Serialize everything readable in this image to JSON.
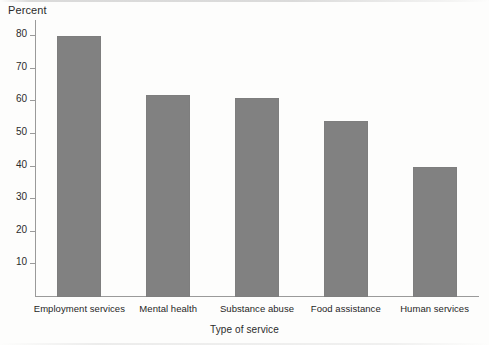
{
  "chart_data": {
    "type": "bar",
    "title": "",
    "subtitle": "",
    "categories": [
      "Employment services",
      "Mental health",
      "Substance abuse",
      "Food assistance",
      "Human services"
    ],
    "values": [
      80,
      62,
      61,
      54,
      40
    ],
    "series": [
      {
        "name": "Percent",
        "values": [
          80,
          62,
          61,
          54,
          40
        ]
      }
    ],
    "xlabel": "Type of service",
    "ylabel": "Percent",
    "ylim": [
      0,
      85
    ],
    "yticks": [
      10,
      20,
      30,
      40,
      50,
      60,
      70,
      80
    ],
    "ytick_labels": [
      "10",
      "20",
      "30",
      "40",
      "50",
      "60",
      "70",
      "80"
    ],
    "grid": false,
    "legend": false,
    "legend_position": "none",
    "bar_color": "#818181",
    "axis_color": "#9a9a9a",
    "text_color": "#2b2b2b",
    "background": "#fdfdfc",
    "annotations": []
  }
}
